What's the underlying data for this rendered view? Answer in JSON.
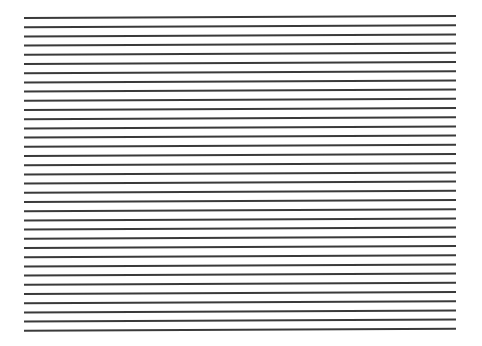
{
  "figure": {
    "line_count": 35,
    "x_start": 24,
    "x_end": 456,
    "y_first_left": 18,
    "y_first_right": 16,
    "spacing": 9.2,
    "stroke_width": 2,
    "color": "#3a3a3a"
  }
}
